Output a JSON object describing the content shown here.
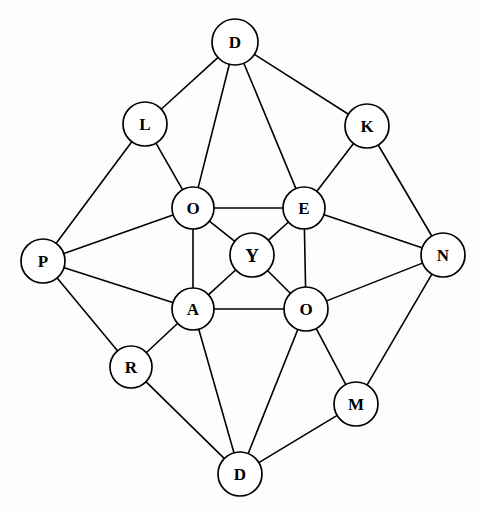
{
  "diagram": {
    "type": "node-link-graph",
    "width": 482,
    "height": 513,
    "background_color": "#fdfdfb",
    "node_fill_color": "#ffffff",
    "node_stroke_color": "#000000",
    "edge_color": "#000000",
    "label_color": "#000000",
    "nodes": [
      {
        "id": "d-top",
        "label": "D",
        "x": 235,
        "y": 42,
        "r": 23,
        "emphasis": false
      },
      {
        "id": "l",
        "label": "L",
        "x": 145,
        "y": 124,
        "r": 22,
        "emphasis": false
      },
      {
        "id": "k",
        "label": "K",
        "x": 367,
        "y": 126,
        "r": 22,
        "emphasis": false
      },
      {
        "id": "o-upper",
        "label": "O",
        "x": 193,
        "y": 208,
        "r": 21,
        "emphasis": false
      },
      {
        "id": "e",
        "label": "E",
        "x": 304,
        "y": 208,
        "r": 21,
        "emphasis": false
      },
      {
        "id": "p",
        "label": "P",
        "x": 43,
        "y": 261,
        "r": 22,
        "emphasis": false
      },
      {
        "id": "y-center",
        "label": "Y",
        "x": 252,
        "y": 255,
        "r": 22,
        "emphasis": true
      },
      {
        "id": "n",
        "label": "N",
        "x": 443,
        "y": 255,
        "r": 22,
        "emphasis": false
      },
      {
        "id": "a",
        "label": "A",
        "x": 193,
        "y": 309,
        "r": 21,
        "emphasis": false
      },
      {
        "id": "o-lower",
        "label": "O",
        "x": 306,
        "y": 309,
        "r": 22,
        "emphasis": false
      },
      {
        "id": "r",
        "label": "R",
        "x": 131,
        "y": 367,
        "r": 21,
        "emphasis": false
      },
      {
        "id": "m",
        "label": "M",
        "x": 356,
        "y": 404,
        "r": 22,
        "emphasis": false
      },
      {
        "id": "d-bottom",
        "label": "D",
        "x": 240,
        "y": 474,
        "r": 22,
        "emphasis": false
      }
    ],
    "edges": [
      {
        "from": "d-top",
        "to": "l"
      },
      {
        "from": "d-top",
        "to": "o-upper"
      },
      {
        "from": "d-top",
        "to": "e"
      },
      {
        "from": "d-top",
        "to": "k"
      },
      {
        "from": "l",
        "to": "p"
      },
      {
        "from": "l",
        "to": "o-upper"
      },
      {
        "from": "k",
        "to": "e"
      },
      {
        "from": "k",
        "to": "n"
      },
      {
        "from": "o-upper",
        "to": "e"
      },
      {
        "from": "o-upper",
        "to": "p"
      },
      {
        "from": "o-upper",
        "to": "y-center"
      },
      {
        "from": "o-upper",
        "to": "a"
      },
      {
        "from": "e",
        "to": "y-center"
      },
      {
        "from": "e",
        "to": "n"
      },
      {
        "from": "e",
        "to": "o-lower"
      },
      {
        "from": "p",
        "to": "a"
      },
      {
        "from": "p",
        "to": "r"
      },
      {
        "from": "y-center",
        "to": "a"
      },
      {
        "from": "y-center",
        "to": "o-lower"
      },
      {
        "from": "n",
        "to": "o-lower"
      },
      {
        "from": "n",
        "to": "m"
      },
      {
        "from": "a",
        "to": "o-lower"
      },
      {
        "from": "a",
        "to": "r"
      },
      {
        "from": "a",
        "to": "d-bottom"
      },
      {
        "from": "o-lower",
        "to": "m"
      },
      {
        "from": "o-lower",
        "to": "d-bottom"
      },
      {
        "from": "r",
        "to": "d-bottom"
      },
      {
        "from": "m",
        "to": "d-bottom"
      }
    ]
  }
}
